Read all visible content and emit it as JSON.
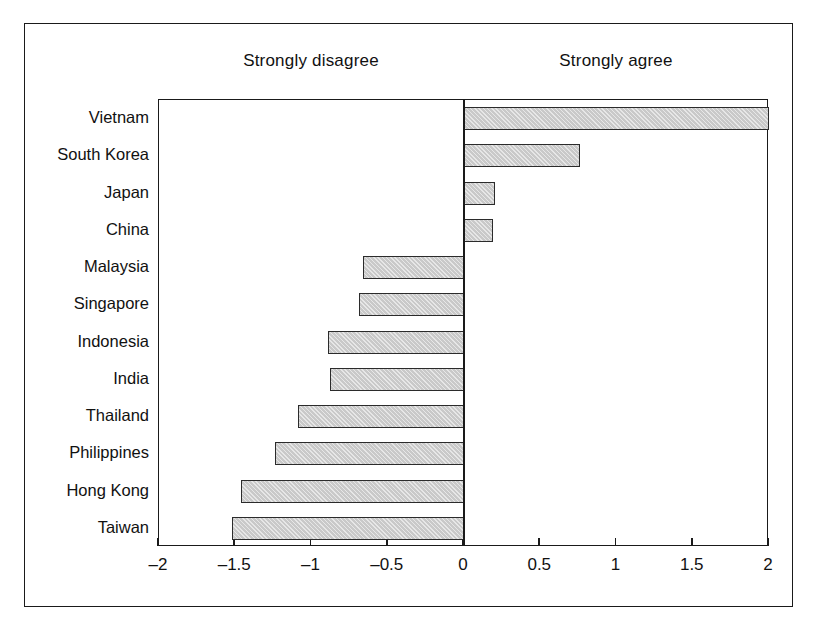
{
  "figure": {
    "caption_left": "Strongly disagree",
    "caption_right": "Strongly agree"
  },
  "chart_data": {
    "type": "bar",
    "orientation": "horizontal",
    "title": "",
    "subtitle": "",
    "xlabel": "",
    "ylabel": "",
    "xlim": [
      -2,
      2
    ],
    "xticks": [
      -2,
      -1.5,
      -1,
      -0.5,
      0,
      0.5,
      1,
      1.5,
      2
    ],
    "xtick_labels": [
      "–2",
      "–1.5",
      "–1",
      "–0.5",
      "0",
      "0.5",
      "1",
      "1.5",
      "2"
    ],
    "grid": false,
    "legend": null,
    "annotations": [
      "Strongly disagree",
      "Strongly agree"
    ],
    "categories": [
      "Vietnam",
      "South Korea",
      "Japan",
      "China",
      "Malaysia",
      "Singapore",
      "Indonesia",
      "India",
      "Thailand",
      "Philippines",
      "Hong Kong",
      "Taiwan"
    ],
    "values": [
      2.0,
      0.76,
      0.2,
      0.19,
      -0.66,
      -0.69,
      -0.89,
      -0.88,
      -1.09,
      -1.24,
      -1.46,
      -1.52
    ],
    "bar_fill_color": "#c9c9c9",
    "bar_edge_color": "#2b2b2b",
    "zero_line_color": "#1a1a1a"
  }
}
